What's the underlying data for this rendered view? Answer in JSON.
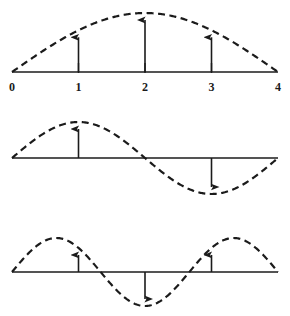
{
  "figure": {
    "title": "",
    "background_color": "#ffffff",
    "ink_color": "#1b1b1b",
    "width": 290,
    "height": 316,
    "axis_labels": [
      "0",
      "1",
      "2",
      "3",
      "4"
    ],
    "axis_label_values": [
      0,
      1,
      2,
      3,
      4
    ]
  },
  "chart_data": {
    "type": "line",
    "title": "",
    "subtitle": "",
    "xlabel": "",
    "ylabel": "",
    "xlim": [
      0,
      4
    ],
    "grid": false,
    "legend": null,
    "panels": [
      {
        "name": "mode-1",
        "curve_label": "half sine",
        "periods": 0.5,
        "amplitude": 1.0,
        "has_axis": true,
        "tick_values": [
          0,
          1,
          2,
          3,
          4
        ],
        "tick_labels": [
          "0",
          "1",
          "2",
          "3",
          "4"
        ],
        "x": [
          0,
          0.25,
          0.5,
          0.75,
          1,
          1.25,
          1.5,
          1.75,
          2,
          2.25,
          2.5,
          2.75,
          3,
          3.25,
          3.5,
          3.75,
          4
        ],
        "y": [
          0,
          0.195,
          0.383,
          0.556,
          0.707,
          0.831,
          0.924,
          0.981,
          1.0,
          0.981,
          0.924,
          0.831,
          0.707,
          0.556,
          0.383,
          0.195,
          0
        ],
        "arrows": [
          {
            "x": 1,
            "value": 0.707,
            "direction": "up"
          },
          {
            "x": 2,
            "value": 1.0,
            "direction": "up"
          },
          {
            "x": 3,
            "value": 0.707,
            "direction": "up"
          }
        ]
      },
      {
        "name": "mode-2",
        "curve_label": "full sine",
        "periods": 1.0,
        "amplitude": 1.0,
        "has_axis": false,
        "tick_values": [],
        "tick_labels": [],
        "x": [
          0,
          0.25,
          0.5,
          0.75,
          1,
          1.25,
          1.5,
          1.75,
          2,
          2.25,
          2.5,
          2.75,
          3,
          3.25,
          3.5,
          3.75,
          4
        ],
        "y": [
          0,
          0.383,
          0.707,
          0.924,
          1.0,
          0.924,
          0.707,
          0.383,
          0,
          -0.383,
          -0.707,
          -0.924,
          -1.0,
          -0.924,
          -0.707,
          -0.383,
          0
        ],
        "arrows": [
          {
            "x": 1,
            "value": 1.0,
            "direction": "up"
          },
          {
            "x": 3,
            "value": -1.0,
            "direction": "down"
          }
        ]
      },
      {
        "name": "mode-3",
        "curve_label": "one-and-a-half sine",
        "periods": 1.5,
        "amplitude": 1.0,
        "has_axis": false,
        "tick_values": [],
        "tick_labels": [],
        "x": [
          0,
          0.25,
          0.5,
          0.75,
          1,
          1.25,
          1.5,
          1.75,
          2,
          2.25,
          2.5,
          2.75,
          3,
          3.25,
          3.5,
          3.75,
          4
        ],
        "y": [
          0,
          0.556,
          0.924,
          0.981,
          0.707,
          0.195,
          -0.383,
          -0.831,
          -1.0,
          -0.831,
          -0.383,
          0.195,
          0.707,
          0.981,
          0.924,
          0.556,
          0
        ],
        "arrows": [
          {
            "x": 1,
            "value": 0.707,
            "direction": "up"
          },
          {
            "x": 2,
            "value": -1.0,
            "direction": "down"
          },
          {
            "x": 3,
            "value": 0.707,
            "direction": "up"
          }
        ]
      }
    ]
  }
}
